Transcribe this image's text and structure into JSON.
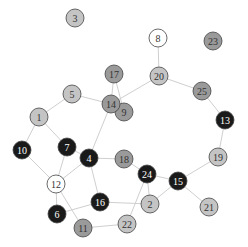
{
  "diagram": {
    "type": "network-graph",
    "node_radius": 9,
    "colors": {
      "white": "#ffffff",
      "light": "#c4c4c4",
      "mid": "#9a9a9a",
      "black": "#1a1a1a"
    },
    "label_colors": {
      "white": "#333333",
      "light": "#333333",
      "mid": "#333333",
      "black": "#ffffff"
    },
    "nodes": [
      {
        "id": "1",
        "x": 39,
        "y": 117,
        "shade": "light"
      },
      {
        "id": "2",
        "x": 150,
        "y": 204,
        "shade": "light"
      },
      {
        "id": "3",
        "x": 75,
        "y": 18,
        "shade": "light"
      },
      {
        "id": "4",
        "x": 89,
        "y": 158,
        "shade": "black"
      },
      {
        "id": "5",
        "x": 72,
        "y": 94,
        "shade": "light"
      },
      {
        "id": "6",
        "x": 57,
        "y": 214,
        "shade": "black"
      },
      {
        "id": "7",
        "x": 67,
        "y": 147,
        "shade": "black"
      },
      {
        "id": "8",
        "x": 158,
        "y": 38,
        "shade": "white"
      },
      {
        "id": "9",
        "x": 124,
        "y": 112,
        "shade": "mid"
      },
      {
        "id": "10",
        "x": 22,
        "y": 150,
        "shade": "black"
      },
      {
        "id": "11",
        "x": 83,
        "y": 228,
        "shade": "mid"
      },
      {
        "id": "12",
        "x": 56,
        "y": 184,
        "shade": "white"
      },
      {
        "id": "13",
        "x": 225,
        "y": 120,
        "shade": "black"
      },
      {
        "id": "14",
        "x": 111,
        "y": 104,
        "shade": "mid"
      },
      {
        "id": "15",
        "x": 178,
        "y": 181,
        "shade": "black"
      },
      {
        "id": "16",
        "x": 100,
        "y": 202,
        "shade": "black"
      },
      {
        "id": "17",
        "x": 114,
        "y": 74,
        "shade": "mid"
      },
      {
        "id": "18",
        "x": 124,
        "y": 159,
        "shade": "mid"
      },
      {
        "id": "19",
        "x": 218,
        "y": 157,
        "shade": "light"
      },
      {
        "id": "20",
        "x": 159,
        "y": 76,
        "shade": "light"
      },
      {
        "id": "21",
        "x": 209,
        "y": 207,
        "shade": "light"
      },
      {
        "id": "22",
        "x": 127,
        "y": 224,
        "shade": "light"
      },
      {
        "id": "23",
        "x": 213,
        "y": 41,
        "shade": "mid"
      },
      {
        "id": "24",
        "x": 147,
        "y": 174,
        "shade": "black"
      },
      {
        "id": "25",
        "x": 202,
        "y": 91,
        "shade": "mid"
      }
    ],
    "edges": [
      [
        "5",
        "1"
      ],
      [
        "5",
        "14"
      ],
      [
        "17",
        "14"
      ],
      [
        "17",
        "9"
      ],
      [
        "14",
        "9"
      ],
      [
        "14",
        "20"
      ],
      [
        "20",
        "8"
      ],
      [
        "20",
        "25"
      ],
      [
        "25",
        "13"
      ],
      [
        "13",
        "19"
      ],
      [
        "19",
        "15"
      ],
      [
        "15",
        "21"
      ],
      [
        "15",
        "24"
      ],
      [
        "15",
        "2"
      ],
      [
        "24",
        "18"
      ],
      [
        "24",
        "2"
      ],
      [
        "24",
        "22"
      ],
      [
        "18",
        "4"
      ],
      [
        "4",
        "7"
      ],
      [
        "4",
        "14"
      ],
      [
        "4",
        "12"
      ],
      [
        "4",
        "16"
      ],
      [
        "7",
        "1"
      ],
      [
        "7",
        "12"
      ],
      [
        "1",
        "10"
      ],
      [
        "10",
        "12"
      ],
      [
        "12",
        "6"
      ],
      [
        "12",
        "11"
      ],
      [
        "6",
        "16"
      ],
      [
        "16",
        "2"
      ],
      [
        "11",
        "22"
      ]
    ]
  }
}
